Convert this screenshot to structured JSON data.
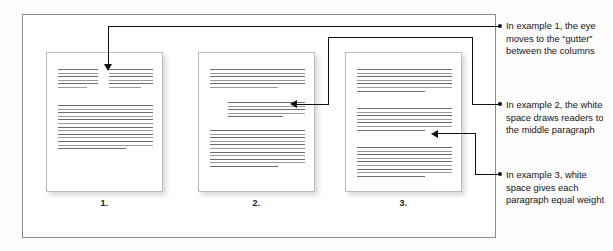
{
  "figure": {
    "frame_color": "#8a8a8a",
    "line_color": "#6d6d6d",
    "callout_color": "#111111"
  },
  "pages": [
    {
      "id": "page1",
      "label": "1.",
      "description": "Two-column top section with a gutter, full-width body below",
      "columns": 2,
      "top_left_lines": 6,
      "top_right_lines": 6,
      "body_lines": 13
    },
    {
      "id": "page2",
      "label": "2.",
      "description": "Top block, indented middle paragraph surrounded by white space, bottom block",
      "top_lines": 6,
      "middle_lines": 5,
      "bottom_lines": 11
    },
    {
      "id": "page3",
      "label": "3.",
      "description": "Three evenly spaced paragraphs of equal weight",
      "block_a_lines": 7,
      "block_b_lines": 7,
      "block_c_lines": 9
    }
  ],
  "callouts": [
    {
      "id": "callout-1",
      "target": "page1",
      "text": "In example 1, the eye moves to the “gutter” between the columns"
    },
    {
      "id": "callout-2",
      "target": "page2",
      "text": "In example 2, the white space draws readers to the middle paragraph"
    },
    {
      "id": "callout-3",
      "target": "page3",
      "text": "In example 3, white space gives each paragraph equal weight"
    }
  ]
}
